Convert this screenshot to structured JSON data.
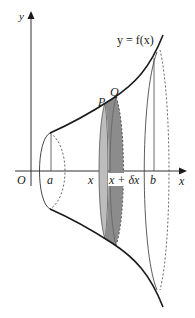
{
  "diagram": {
    "curve_label": "y = f(x)",
    "axis_labels": {
      "y": "y",
      "x": "x",
      "origin": "O"
    },
    "x_markers": {
      "a": "a",
      "x": "x",
      "x_plus_dx": "x + δx",
      "b": "b"
    },
    "points": {
      "P": "P",
      "Q": "Q"
    },
    "colors": {
      "line": "#1a1a1a",
      "thin_line": "#333333",
      "disc_light": "#bdbdbd",
      "disc_dark": "#8c8c8c"
    }
  }
}
